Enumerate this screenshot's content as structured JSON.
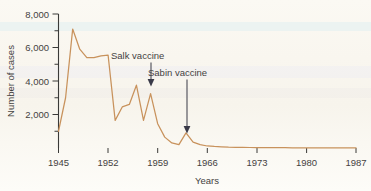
{
  "chart_data": {
    "type": "line",
    "title": "",
    "xlabel": "Years",
    "ylabel": "Number of cases",
    "xlim": [
      1945,
      1987
    ],
    "xticks": [
      1945,
      1952,
      1959,
      1966,
      1973,
      1980,
      1987
    ],
    "xtick_labels": [
      "1945",
      "1952",
      "1959",
      "1966",
      "1973",
      "1980",
      "1987"
    ],
    "ylim": [
      0,
      8000
    ],
    "yticks": [
      2000,
      4000,
      6000,
      8000
    ],
    "ytick_labels": [
      "2,000",
      "4,000",
      "6,000",
      "8,000"
    ],
    "yminor_ticks": [
      1000,
      3000,
      5000,
      7000
    ],
    "grid": false,
    "legend": "none",
    "line_color": "#c8925c",
    "x": [
      1945,
      1946,
      1947,
      1948,
      1949,
      1950,
      1951,
      1952,
      1953,
      1954,
      1955,
      1956,
      1957,
      1958,
      1959,
      1960,
      1961,
      1962,
      1963,
      1964,
      1965,
      1966,
      1967,
      1968,
      1969,
      1970,
      1971,
      1972,
      1973,
      1974,
      1975,
      1976,
      1977,
      1978,
      1979,
      1980,
      1981,
      1982,
      1983,
      1984,
      1985,
      1986,
      1987
    ],
    "values": [
      1000,
      3000,
      7100,
      5900,
      5400,
      5400,
      5500,
      5550,
      1650,
      2450,
      2600,
      3750,
      1650,
      3250,
      1450,
      650,
      300,
      200,
      900,
      350,
      200,
      120,
      90,
      70,
      50,
      40,
      35,
      30,
      25,
      22,
      20,
      18,
      16,
      15,
      14,
      13,
      12,
      11,
      10,
      9,
      8,
      7,
      6
    ],
    "series": [
      {
        "name": "Polio cases",
        "values": [
          1000,
          3000,
          7100,
          5900,
          5400,
          5400,
          5500,
          5550,
          1650,
          2450,
          2600,
          3750,
          1650,
          3250,
          1450,
          650,
          300,
          200,
          900,
          350,
          200,
          120,
          90,
          70,
          50,
          40,
          35,
          30,
          25,
          22,
          20,
          18,
          16,
          15,
          14,
          13,
          12,
          11,
          10,
          9,
          8,
          7,
          6
        ]
      }
    ],
    "annotations": [
      {
        "label": "Salk vaccine",
        "year": 1957,
        "value": 3750
      },
      {
        "label": "Sabin vaccine",
        "year": 1962,
        "value": 900
      }
    ]
  }
}
